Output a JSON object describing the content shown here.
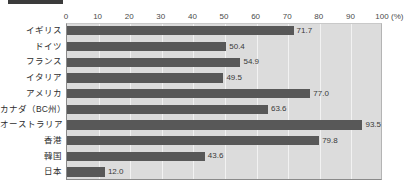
{
  "chart_data": {
    "type": "bar",
    "orientation": "horizontal",
    "title": "",
    "xlabel": "(%)",
    "ylabel": "",
    "xlim": [
      0,
      100
    ],
    "xticks": [
      0,
      10,
      20,
      30,
      40,
      50,
      60,
      70,
      80,
      90,
      100
    ],
    "xtick_labels": [
      "0",
      "10",
      "20",
      "30",
      "40",
      "50",
      "60",
      "70",
      "80",
      "90",
      "100"
    ],
    "unit_label": "(%)",
    "grid": true,
    "legend": false,
    "categories": [
      "イギリス",
      "ドイツ",
      "フランス",
      "イタリア",
      "アメリカ",
      "カナダ（BC州）",
      "オーストラリア",
      "香港",
      "韓国",
      "日本"
    ],
    "values": [
      71.7,
      50.4,
      54.9,
      49.5,
      77.0,
      63.6,
      93.5,
      79.8,
      43.6,
      12.0
    ],
    "value_labels": [
      "71.7",
      "50.4",
      "54.9",
      "49.5",
      "77.0",
      "63.6",
      "93.5",
      "79.8",
      "43.6",
      "12.0"
    ],
    "colors": {
      "bar": "#585858",
      "plot_background": "#dcdcdc",
      "gridline": "#f2f2f2",
      "axis": "#8a8a8a",
      "text": "#2e2e2e",
      "rule": "#3b3b3b"
    }
  }
}
